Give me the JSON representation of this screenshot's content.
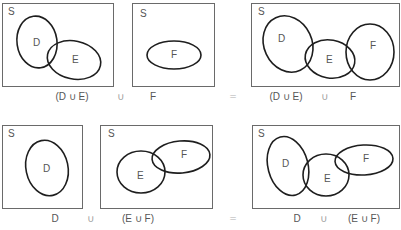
{
  "figure": {
    "colors": {
      "box_stroke": "#6a6a6a",
      "ellipse_stroke": "#1e1e1e",
      "text": "#555555"
    },
    "rows": [
      {
        "name": "row-1",
        "panels": [
          {
            "name": "panel-d-union-e",
            "box": {
              "x": 2.5,
              "y": 3.5,
              "w": 111,
              "h": 83
            },
            "universe_label": {
              "text": "S",
              "x": 8,
              "y": 15
            },
            "sets": [
              {
                "label": "D",
                "cx": 37,
                "cy": 42,
                "rx": 20,
                "ry": 26,
                "rot": -8,
                "lx": 33,
                "ly": 46
              },
              {
                "label": "E",
                "cx": 74,
                "cy": 60,
                "rx": 27,
                "ry": 19,
                "rot": 12,
                "lx": 72,
                "ly": 63
              }
            ]
          },
          {
            "name": "panel-f",
            "box": {
              "x": 132.5,
              "y": 3.5,
              "w": 82,
              "h": 83
            },
            "universe_label": {
              "text": "S",
              "x": 140,
              "y": 17
            },
            "sets": [
              {
                "label": "F",
                "cx": 174,
                "cy": 55,
                "rx": 27,
                "ry": 14,
                "rot": 0,
                "lx": 171,
                "ly": 58
              }
            ]
          },
          {
            "name": "panel-result-1",
            "box": {
              "x": 251.5,
              "y": 3.5,
              "w": 148,
              "h": 83
            },
            "universe_label": {
              "text": "S",
              "x": 258,
              "y": 15
            },
            "sets": [
              {
                "label": "D",
                "cx": 288,
                "cy": 44,
                "rx": 24,
                "ry": 29,
                "rot": -25,
                "lx": 278,
                "ly": 42
              },
              {
                "label": "E",
                "cx": 330,
                "cy": 59,
                "rx": 25,
                "ry": 19,
                "rot": 10,
                "lx": 326,
                "ly": 63
              },
              {
                "label": "F",
                "cx": 370,
                "cy": 52,
                "rx": 24,
                "ry": 28,
                "rot": 0,
                "lx": 370,
                "ly": 49
              }
            ]
          }
        ],
        "captions": [
          {
            "text": "(D ∪ E)",
            "x": 72,
            "y": 100,
            "kind": "caption"
          },
          {
            "text": "∪",
            "x": 121,
            "y": 100,
            "kind": "op"
          },
          {
            "text": "F",
            "x": 153,
            "y": 100,
            "kind": "caption"
          },
          {
            "text": "=",
            "x": 233,
            "y": 99,
            "kind": "eq"
          },
          {
            "text": "(D ∪ E)",
            "x": 286,
            "y": 100,
            "kind": "caption"
          },
          {
            "text": "∪",
            "x": 325,
            "y": 100,
            "kind": "op"
          },
          {
            "text": "F",
            "x": 353,
            "y": 100,
            "kind": "caption"
          }
        ]
      },
      {
        "name": "row-2",
        "panels": [
          {
            "name": "panel-d",
            "box": {
              "x": 2.5,
              "y": 125.5,
              "w": 80,
              "h": 83
            },
            "universe_label": {
              "text": "S",
              "x": 8,
              "y": 137
            },
            "sets": [
              {
                "label": "D",
                "cx": 47,
                "cy": 168,
                "rx": 21,
                "ry": 28,
                "rot": -12,
                "lx": 43,
                "ly": 172
              }
            ]
          },
          {
            "name": "panel-e-union-f",
            "box": {
              "x": 100.5,
              "y": 125.5,
              "w": 112,
              "h": 83
            },
            "universe_label": {
              "text": "S",
              "x": 108,
              "y": 137
            },
            "sets": [
              {
                "label": "E",
                "cx": 141,
                "cy": 172,
                "rx": 24,
                "ry": 21,
                "rot": 0,
                "lx": 137,
                "ly": 179
              },
              {
                "label": "F",
                "cx": 181,
                "cy": 157,
                "rx": 29,
                "ry": 16,
                "rot": -5,
                "lx": 181,
                "ly": 158
              }
            ]
          },
          {
            "name": "panel-result-2",
            "box": {
              "x": 252.5,
              "y": 125.5,
              "w": 147,
              "h": 83
            },
            "universe_label": {
              "text": "S",
              "x": 258,
              "y": 137
            },
            "sets": [
              {
                "label": "D",
                "cx": 288,
                "cy": 166,
                "rx": 20,
                "ry": 30,
                "rot": -15,
                "lx": 282,
                "ly": 167
              },
              {
                "label": "E",
                "cx": 326,
                "cy": 175,
                "rx": 23,
                "ry": 21,
                "rot": 0,
                "lx": 324,
                "ly": 182
              },
              {
                "label": "F",
                "cx": 364,
                "cy": 160,
                "rx": 29,
                "ry": 15,
                "rot": -3,
                "lx": 363,
                "ly": 162
              }
            ]
          }
        ],
        "captions": [
          {
            "text": "D",
            "x": 55,
            "y": 222,
            "kind": "caption"
          },
          {
            "text": "∪",
            "x": 91,
            "y": 222,
            "kind": "op"
          },
          {
            "text": "(E ∪ F)",
            "x": 138,
            "y": 222,
            "kind": "caption"
          },
          {
            "text": "=",
            "x": 233,
            "y": 221,
            "kind": "eq"
          },
          {
            "text": "D",
            "x": 297,
            "y": 222,
            "kind": "caption"
          },
          {
            "text": "∪",
            "x": 324,
            "y": 222,
            "kind": "op"
          },
          {
            "text": "(E ∪ F)",
            "x": 364,
            "y": 222,
            "kind": "caption"
          }
        ]
      }
    ]
  }
}
